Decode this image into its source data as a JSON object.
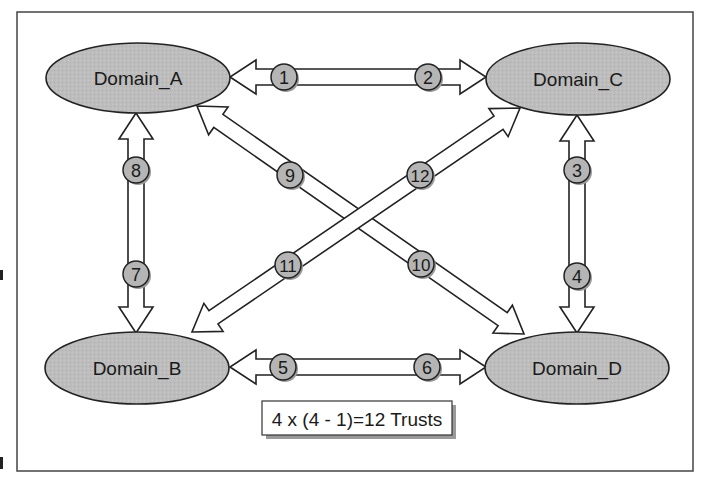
{
  "diagram": {
    "type": "full-mesh trust relationships",
    "colors": {
      "domain_fill": "#bdbdbd",
      "badge_fill": "#b5b5b5",
      "stroke": "#222222",
      "arrow_fill": "#ffffff",
      "shadow": "#9a9a9a",
      "frame": "#444444"
    },
    "domains": [
      {
        "id": "A",
        "label": "Domain_A",
        "cx": 138,
        "cy": 78
      },
      {
        "id": "C",
        "label": "Domain_C",
        "cx": 578,
        "cy": 79
      },
      {
        "id": "B",
        "label": "Domain_B",
        "cx": 137,
        "cy": 368
      },
      {
        "id": "D",
        "label": "Domain_D",
        "cx": 577,
        "cy": 368
      }
    ],
    "trusts": [
      {
        "number": "1",
        "from": "C",
        "to": "A",
        "bx": 284,
        "by": 77
      },
      {
        "number": "2",
        "from": "A",
        "to": "C",
        "bx": 428,
        "by": 77
      },
      {
        "number": "3",
        "from": "D",
        "to": "C",
        "bx": 577,
        "by": 170
      },
      {
        "number": "4",
        "from": "C",
        "to": "D",
        "bx": 577,
        "by": 276
      },
      {
        "number": "5",
        "from": "D",
        "to": "B",
        "bx": 283,
        "by": 367
      },
      {
        "number": "6",
        "from": "B",
        "to": "D",
        "bx": 427,
        "by": 367
      },
      {
        "number": "7",
        "from": "A",
        "to": "B",
        "bx": 136,
        "by": 274
      },
      {
        "number": "8",
        "from": "B",
        "to": "A",
        "bx": 136,
        "by": 170
      },
      {
        "number": "9",
        "from": "D",
        "to": "A",
        "bx": 290,
        "by": 175
      },
      {
        "number": "10",
        "from": "A",
        "to": "D",
        "bx": 421,
        "by": 264
      },
      {
        "number": "11",
        "from": "C",
        "to": "B",
        "bx": 288,
        "by": 265
      },
      {
        "number": "12",
        "from": "B",
        "to": "C",
        "bx": 420,
        "by": 175
      }
    ],
    "formula": "4 x (4 - 1)=12 Trusts"
  }
}
